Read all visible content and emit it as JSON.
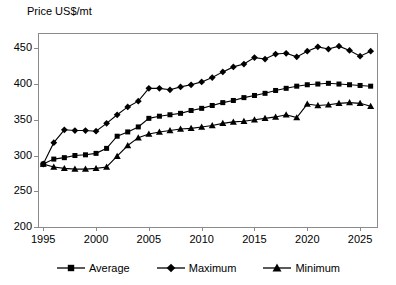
{
  "chart_data": {
    "type": "line",
    "title": "",
    "ylabel": "Price US$/mt",
    "xlabel": "",
    "ylim": [
      200,
      470
    ],
    "xlim": [
      1994.6,
      2026.6
    ],
    "yticks": [
      200,
      250,
      300,
      350,
      400,
      450
    ],
    "xticks": [
      1995,
      2000,
      2005,
      2010,
      2015,
      2020,
      2025
    ],
    "grid": false,
    "legend_position": "bottom",
    "x": [
      1995,
      1996,
      1997,
      1998,
      1999,
      2000,
      2001,
      2002,
      2003,
      2004,
      2005,
      2006,
      2007,
      2008,
      2009,
      2010,
      2011,
      2012,
      2013,
      2014,
      2015,
      2016,
      2017,
      2018,
      2019,
      2020,
      2021,
      2022,
      2023,
      2024,
      2025,
      2026
    ],
    "series": [
      {
        "name": "Average",
        "marker": "square",
        "values": [
          288,
          295,
          297,
          300,
          301,
          303,
          310,
          327,
          333,
          340,
          352,
          355,
          357,
          359,
          363,
          366,
          370,
          374,
          377,
          381,
          384,
          387,
          391,
          394,
          397,
          399,
          400,
          401,
          400,
          399,
          398,
          397
        ]
      },
      {
        "name": "Maximum",
        "marker": "diamond",
        "values": [
          288,
          318,
          336,
          335,
          335,
          334,
          345,
          357,
          368,
          376,
          394,
          394,
          392,
          396,
          399,
          403,
          409,
          417,
          424,
          428,
          437,
          435,
          442,
          443,
          438,
          446,
          452,
          449,
          453,
          447,
          439,
          446
        ]
      },
      {
        "name": "Minimum",
        "marker": "triangle",
        "values": [
          288,
          284,
          282,
          281,
          281,
          282,
          284,
          299,
          314,
          325,
          330,
          333,
          335,
          337,
          338,
          340,
          342,
          345,
          347,
          348,
          350,
          352,
          354,
          357,
          353,
          372,
          370,
          371,
          373,
          374,
          373,
          369
        ]
      }
    ]
  },
  "legend": {
    "items": [
      {
        "label": "Average",
        "marker": "square"
      },
      {
        "label": "Maximum",
        "marker": "diamond"
      },
      {
        "label": "Minimum",
        "marker": "triangle"
      }
    ]
  }
}
